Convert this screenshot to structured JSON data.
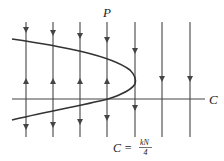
{
  "diagram": {
    "type": "phase-line bifurcation diagram",
    "axes": {
      "horizontal_label": "C",
      "vertical_label": "P"
    },
    "annotation": {
      "lhs": "C =",
      "numerator": "kN",
      "denominator": "4"
    },
    "vertical_lines": [
      {
        "x": 26,
        "arrows": [
          {
            "y": 30,
            "dir": "down"
          },
          {
            "y": 81,
            "dir": "up"
          },
          {
            "y": 127,
            "dir": "down"
          }
        ]
      },
      {
        "x": 53,
        "arrows": [
          {
            "y": 30,
            "dir": "down"
          },
          {
            "y": 81,
            "dir": "up"
          },
          {
            "y": 127,
            "dir": "down"
          }
        ]
      },
      {
        "x": 80,
        "arrows": [
          {
            "y": 35,
            "dir": "down"
          },
          {
            "y": 81,
            "dir": "up"
          },
          {
            "y": 122,
            "dir": "down"
          }
        ]
      },
      {
        "x": 107,
        "arrows": [
          {
            "y": 38,
            "dir": "down"
          },
          {
            "y": 81,
            "dir": "up"
          },
          {
            "y": 117,
            "dir": "down"
          }
        ]
      },
      {
        "x": 135,
        "arrows": [
          {
            "y": 50,
            "dir": "down"
          },
          {
            "y": 108,
            "dir": "down"
          }
        ]
      },
      {
        "x": 162,
        "arrows": [
          {
            "y": 79,
            "dir": "down"
          }
        ]
      },
      {
        "x": 190,
        "arrows": [
          {
            "y": 79,
            "dir": "down"
          }
        ]
      }
    ],
    "colors": {
      "line": "#555555",
      "curve": "#333333",
      "text": "#222222"
    }
  }
}
